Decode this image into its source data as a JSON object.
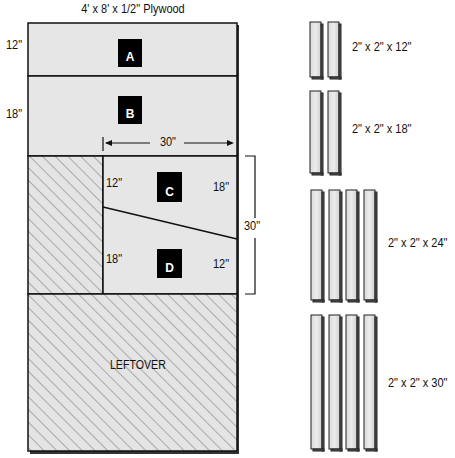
{
  "title": "4' x 8' x 1/2\" Plywood",
  "sheet": {
    "panels": [
      {
        "id": "A",
        "label": "A",
        "height_label": "12\""
      },
      {
        "id": "B",
        "label": "B",
        "height_label": "18\""
      },
      {
        "id": "C",
        "label": "C",
        "left_label": "12\"",
        "right_label": "18\""
      },
      {
        "id": "D",
        "label": "D",
        "left_label": "18\"",
        "right_label": "12\""
      }
    ],
    "width_dimension": "30\"",
    "height_dimension": "30\"",
    "leftover_label": "LEFTOVER"
  },
  "lumber": [
    {
      "label": "2\" x 2\" x 12\"",
      "count": 2
    },
    {
      "label": "2\" x 2\" x 18\"",
      "count": 2
    },
    {
      "label": "2\" x 2\" x 24\"",
      "count": 4
    },
    {
      "label": "2\" x 2\" x 30\"",
      "count": 4
    }
  ],
  "colors": {
    "panel_fill": "#e6e6e6",
    "hatch": "#777777",
    "line": "#111111",
    "tag_bg": "#000000",
    "tag_text": "#ffffff"
  }
}
